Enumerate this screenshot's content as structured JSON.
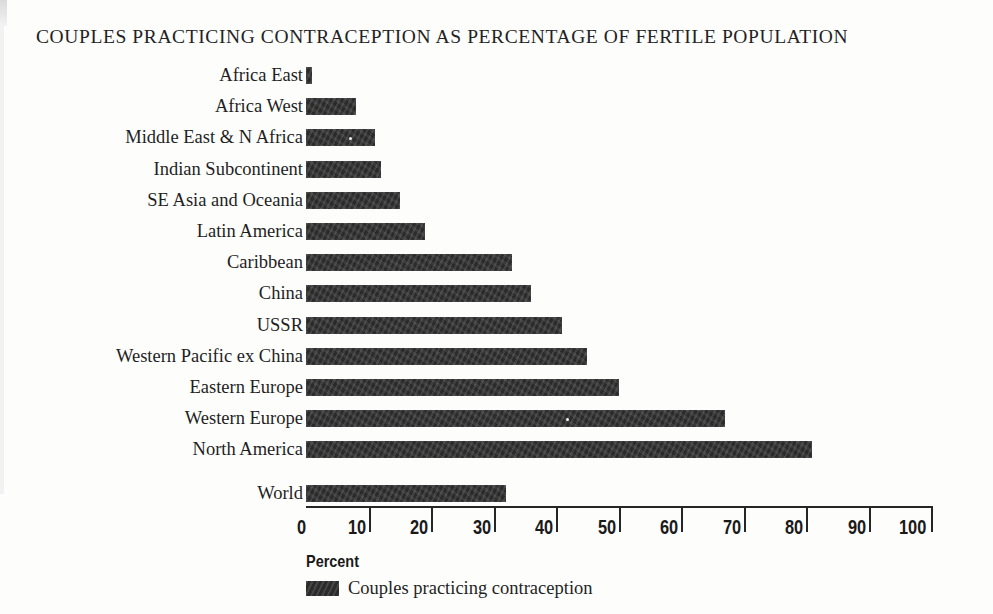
{
  "chart_data": {
    "type": "bar",
    "orientation": "horizontal",
    "title": "COUPLES PRACTICING CONTRACEPTION AS PERCENTAGE OF  FERTILE POPULATION",
    "xlabel": "Percent",
    "ylabel": "",
    "xlim": [
      0,
      100
    ],
    "grid": false,
    "legend_position": "bottom-left",
    "legend": [
      "Couples practicing contraception"
    ],
    "xticks": [
      0,
      10,
      20,
      30,
      40,
      50,
      60,
      70,
      80,
      90,
      100
    ],
    "xtick_labels": [
      "0",
      "10",
      "20",
      "30",
      "40",
      "50",
      "60",
      "70",
      "80",
      "90",
      "100"
    ],
    "categories": [
      "Africa East",
      "Africa West",
      "Middle East & N Africa",
      "Indian Subcontinent",
      "SE Asia and Oceania",
      "Latin America",
      "Caribbean",
      "China",
      "USSR",
      "Western Pacific ex China",
      "Eastern Europe",
      "Western Europe",
      "North America"
    ],
    "values": [
      1,
      8,
      11,
      12,
      15,
      19,
      33,
      36,
      41,
      45,
      50,
      67,
      81
    ],
    "summary_category": "World",
    "summary_value": 32,
    "series": [
      {
        "name": "Couples practicing contraception",
        "color": "#2b2b2b",
        "values": [
          1,
          8,
          11,
          12,
          15,
          19,
          33,
          36,
          41,
          45,
          50,
          67,
          81
        ]
      }
    ]
  }
}
